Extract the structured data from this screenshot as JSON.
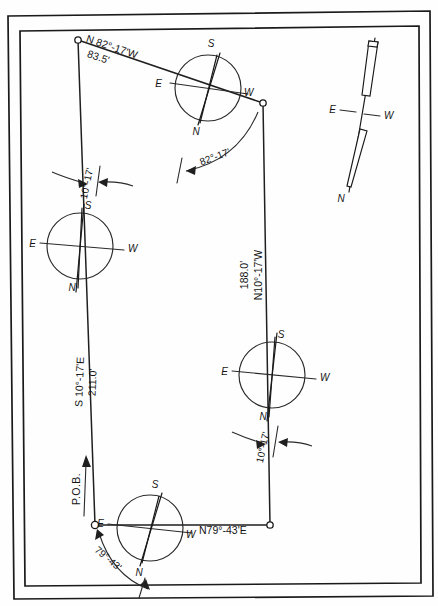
{
  "drawing": {
    "title": "Survey Traverse Plat with Magnetic Compass Roses",
    "frame_color": "#1a1a1a",
    "line_color": "#1f1f1f",
    "paper_color": "#fefefe"
  },
  "point_of_beginning": {
    "label": "P.O.B.",
    "x": 95,
    "y": 525
  },
  "courses": [
    {
      "id": "course-north",
      "bearing": "N 82°-17'W",
      "distance": "83.5'",
      "from": {
        "x": 263,
        "y": 103
      },
      "to": {
        "x": 78,
        "y": 40
      }
    },
    {
      "id": "course-east",
      "bearing": "N10°-17'W",
      "distance": "188.0'",
      "from": {
        "x": 270,
        "y": 525
      },
      "to": {
        "x": 263,
        "y": 103
      }
    },
    {
      "id": "course-west",
      "bearing": "S 10°-17'E",
      "distance": "211.0'",
      "from": {
        "x": 78,
        "y": 40
      },
      "to": {
        "x": 95,
        "y": 525
      }
    },
    {
      "id": "course-south",
      "bearing": "N79°-43'E",
      "distance": "",
      "from": {
        "x": 95,
        "y": 525
      },
      "to": {
        "x": 270,
        "y": 525
      }
    }
  ],
  "deflection_angles": [
    {
      "id": "angle-top-right",
      "value": "82°-17'"
    },
    {
      "id": "angle-upper-left",
      "value": "10°-17'"
    },
    {
      "id": "angle-mid-right",
      "value": "10°-17'"
    },
    {
      "id": "angle-bottom-left",
      "value": "79°-43'"
    }
  ],
  "compass_roses": [
    {
      "id": "compass-top",
      "cx": 208,
      "cy": 88,
      "r": 33,
      "cardinals": {
        "top": "S",
        "bottom": "N",
        "left": "E",
        "right": "W"
      },
      "needle_deg": -18
    },
    {
      "id": "compass-left",
      "cx": 80,
      "cy": 246,
      "r": 33,
      "cardinals": {
        "top": "S",
        "bottom": "N",
        "left": "E",
        "right": "W"
      },
      "needle_deg": -3
    },
    {
      "id": "compass-right",
      "cx": 272,
      "cy": 375,
      "r": 33,
      "cardinals": {
        "top": "S",
        "bottom": "N",
        "left": "E",
        "right": "W"
      },
      "needle_deg": -4
    },
    {
      "id": "compass-bottom",
      "cx": 150,
      "cy": 528,
      "r": 33,
      "cardinals": {
        "top": "S",
        "bottom": "N",
        "left": "E",
        "right": "W"
      },
      "needle_deg": -16
    }
  ],
  "standalone_needle": {
    "id": "magnetic-needle",
    "cx": 365,
    "cy": 113,
    "cardinals": {
      "left": "E",
      "right": "W",
      "south_tip": "N"
    },
    "tilt_deg": 11
  },
  "cardinal_glyphs": {
    "north": "N",
    "south": "S",
    "east": "E",
    "west": "W"
  }
}
